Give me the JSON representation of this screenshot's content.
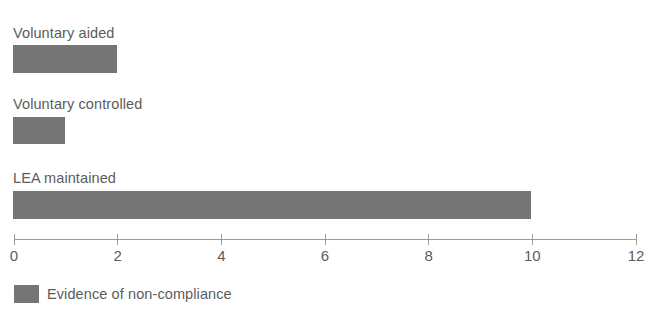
{
  "chart_data": {
    "type": "bar",
    "orientation": "horizontal",
    "title": "",
    "subtitle": "",
    "xlabel": "",
    "ylabel": "",
    "categories": [
      "Voluntary aided",
      "Voluntary controlled",
      "LEA maintained"
    ],
    "values": [
      2,
      1,
      10
    ],
    "series": [
      {
        "name": "Evidence of non-compliance",
        "color": "#757575",
        "values": [
          2,
          1,
          10
        ]
      }
    ],
    "xlim": [
      0,
      12
    ],
    "xticks": [
      0,
      2,
      4,
      6,
      8,
      10,
      12
    ],
    "xtick_labels": [
      "0",
      "2",
      "4",
      "6",
      "8",
      "10",
      "12"
    ],
    "grid": false,
    "legend": {
      "position": "bottom-left",
      "entries": [
        {
          "label": "Evidence of non-compliance",
          "color": "#757575"
        }
      ]
    },
    "colors": {
      "bar": "#757575",
      "text": "#5c5c5c",
      "axis": "#9b9b9b",
      "background": "#ffffff"
    }
  }
}
